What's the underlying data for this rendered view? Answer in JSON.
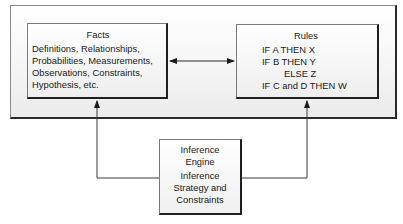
{
  "diagram": {
    "type": "rule-based expert system architecture",
    "nodes": {
      "facts": {
        "title": "Facts",
        "lines": [
          "Definitions, Relationships,",
          "Probabilities, Measurements,",
          "Observations, Constraints,",
          "Hypothesis, etc."
        ]
      },
      "rules": {
        "title": "Rules",
        "lines": [
          "IF A THEN X",
          "IF B THEN Y",
          "ELSE Z",
          "IF C and D THEN W"
        ]
      },
      "engine": {
        "title_lines": [
          "Inference",
          "Engine"
        ],
        "lines": [
          "Inference",
          "Strategy and",
          "Constraints"
        ]
      }
    },
    "edges": [
      {
        "from": "facts",
        "to": "rules",
        "type": "bidirectional"
      },
      {
        "from": "engine",
        "to": "facts",
        "type": "directed"
      },
      {
        "from": "engine",
        "to": "rules",
        "type": "directed"
      }
    ],
    "colors": {
      "line": "#3a3a3a",
      "box_border": "#1f1f1f",
      "fill_top": "#ffffff",
      "fill_bottom": "#eeeeee"
    }
  }
}
